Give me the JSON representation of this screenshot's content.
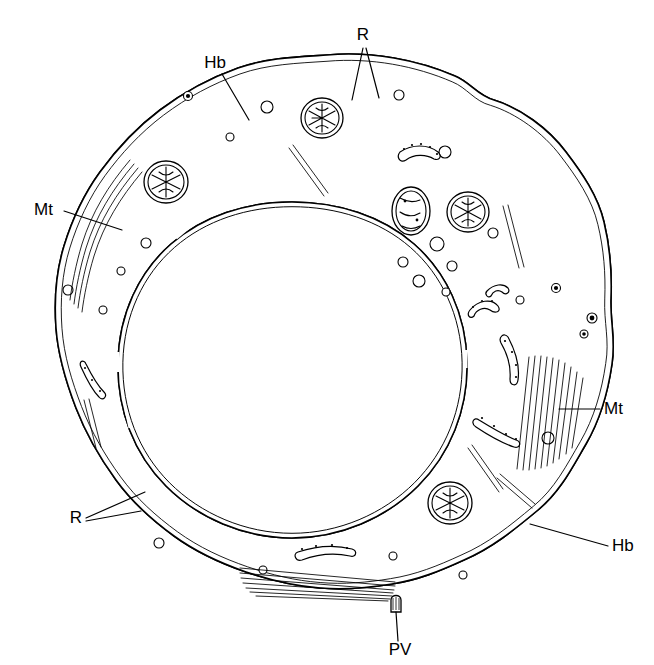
{
  "figure": {
    "background_color": "#ffffff",
    "ink_color": "#000000"
  },
  "labels": [
    {
      "id": "r-top",
      "text": "R",
      "name": "label-r-top",
      "meaning": "ribosomes",
      "x": 363,
      "y": 40,
      "anchor": "middle"
    },
    {
      "id": "hb-top",
      "text": "Hb",
      "name": "label-hb-top",
      "meaning": "heterochromatin body",
      "x": 215,
      "y": 68,
      "anchor": "middle"
    },
    {
      "id": "mt-left",
      "text": "Mt",
      "name": "label-mt-left",
      "meaning": "microtubules",
      "x": 34,
      "y": 215,
      "anchor": "start"
    },
    {
      "id": "mt-right",
      "text": "Mt",
      "name": "label-mt-right",
      "meaning": "microtubules",
      "x": 604,
      "y": 414,
      "anchor": "start"
    },
    {
      "id": "r-bottom",
      "text": "R",
      "name": "label-r-bottom",
      "meaning": "ribosomes",
      "x": 76,
      "y": 523,
      "anchor": "middle"
    },
    {
      "id": "hb-bottom",
      "text": "Hb",
      "name": "label-hb-bottom",
      "meaning": "heterochromatin body",
      "x": 612,
      "y": 551,
      "anchor": "start"
    },
    {
      "id": "pv-bottom",
      "text": "PV",
      "name": "label-pv-bottom",
      "meaning": "pore vesicle",
      "x": 400,
      "y": 655,
      "anchor": "middle"
    }
  ],
  "leaders": [
    {
      "id": "r-top-a",
      "name": "leader-r-top-left",
      "points": "363,48 352,100"
    },
    {
      "id": "r-top-b",
      "name": "leader-r-top-right",
      "points": "366,48 379,98"
    },
    {
      "id": "hb-top",
      "name": "leader-hb-top",
      "points": "222,74 249,120"
    },
    {
      "id": "mt-left",
      "name": "leader-mt-left",
      "points": "64,211 122,230"
    },
    {
      "id": "mt-right",
      "name": "leader-mt-right",
      "points": "600,409 559,409"
    },
    {
      "id": "r-bottom-a",
      "name": "leader-r-bottom-upper",
      "points": "86,518 145,492"
    },
    {
      "id": "r-bottom-b",
      "name": "leader-r-bottom-lower",
      "points": "86,521 141,511"
    },
    {
      "id": "hb-bottom",
      "name": "leader-hb-bottom",
      "points": "608,546 530,524"
    },
    {
      "id": "pv-bottom",
      "name": "leader-pv",
      "points": "398,641 396,612"
    }
  ],
  "cell": {
    "name": "cell-body",
    "center_x": 327,
    "center_y": 340,
    "radius_x": 290,
    "radius_y": 285,
    "membrane": "double-line-irregular"
  },
  "nucleus": {
    "name": "nucleus",
    "center_x": 292,
    "center_y": 370,
    "radius_x": 175,
    "radius_y": 168,
    "envelope": "double-line",
    "chromatin": "stippled with dense clumps"
  },
  "mitochondria": [
    {
      "name": "mitochondrion",
      "cx": 322,
      "cy": 118,
      "rx": 21,
      "ry": 20,
      "cristae": 6
    },
    {
      "name": "mitochondrion",
      "cx": 166,
      "cy": 182,
      "rx": 22,
      "ry": 21,
      "cristae": 6
    },
    {
      "name": "mitochondrion",
      "cx": 411,
      "cy": 211,
      "rx": 19,
      "ry": 24,
      "cristae": 5
    },
    {
      "name": "mitochondrion",
      "cx": 468,
      "cy": 212,
      "rx": 21,
      "ry": 20,
      "cristae": 6
    },
    {
      "name": "mitochondrion",
      "cx": 450,
      "cy": 503,
      "rx": 22,
      "ry": 21,
      "cristae": 6
    }
  ],
  "vesicles": [
    {
      "cx": 267,
      "cy": 107,
      "r": 6
    },
    {
      "cx": 399,
      "cy": 95,
      "r": 5
    },
    {
      "cx": 230,
      "cy": 137,
      "r": 4
    },
    {
      "cx": 445,
      "cy": 152,
      "r": 6
    },
    {
      "cx": 437,
      "cy": 244,
      "r": 7
    },
    {
      "cx": 452,
      "cy": 266,
      "r": 5
    },
    {
      "cx": 403,
      "cy": 262,
      "r": 5
    },
    {
      "cx": 419,
      "cy": 281,
      "r": 6
    },
    {
      "cx": 446,
      "cy": 292,
      "r": 4
    },
    {
      "cx": 493,
      "cy": 233,
      "r": 5
    },
    {
      "cx": 146,
      "cy": 243,
      "r": 5
    },
    {
      "cx": 121,
      "cy": 271,
      "r": 4
    },
    {
      "cx": 68,
      "cy": 290,
      "r": 5
    },
    {
      "cx": 103,
      "cy": 310,
      "r": 4
    },
    {
      "cx": 520,
      "cy": 300,
      "r": 4
    },
    {
      "cx": 548,
      "cy": 438,
      "r": 6
    },
    {
      "cx": 159,
      "cy": 543,
      "r": 5
    },
    {
      "cx": 393,
      "cy": 556,
      "r": 4
    },
    {
      "cx": 463,
      "cy": 575,
      "r": 4
    },
    {
      "cx": 263,
      "cy": 570,
      "r": 4
    }
  ],
  "microtubule_bundles": [
    {
      "name": "microtubule-bundle-left",
      "count": 4,
      "orientation": "curved-along-membrane"
    },
    {
      "name": "microtubule-bundle-right",
      "count": 10,
      "orientation": "near-vertical"
    },
    {
      "name": "microtubule-bundle-bottom",
      "count": 7,
      "orientation": "horizontal"
    }
  ],
  "er_cisternae": [
    {
      "name": "er-cisterna-upper-right"
    },
    {
      "name": "er-cisterna-mid-right"
    },
    {
      "name": "er-cisterna-lower-right"
    },
    {
      "name": "er-cisterna-bottom"
    },
    {
      "name": "er-cisterna-left"
    }
  ],
  "pore": {
    "name": "pore-vesicle",
    "x": 396,
    "y": 600,
    "width": 11,
    "height": 14
  }
}
